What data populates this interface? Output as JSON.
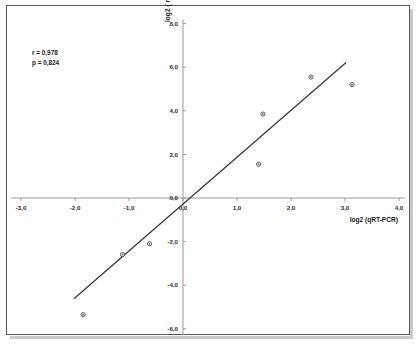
{
  "chart_data": {
    "type": "scatter",
    "title": "",
    "xlabel": "log2 (qRT-PCR)",
    "ylabel": "log2 ( microarray)",
    "xlim": [
      -3.0,
      4.0
    ],
    "ylim": [
      -6.0,
      8.0
    ],
    "xticks": [
      "-3,0",
      "-2,0",
      "-1,0",
      "0,0",
      "1,0",
      "2,0",
      "3,0",
      "4,0"
    ],
    "xtick_values": [
      -3.0,
      -2.0,
      -1.0,
      0.0,
      1.0,
      2.0,
      3.0,
      4.0
    ],
    "yticks": [
      "8,0",
      "6,0",
      "4,0",
      "2,0",
      "0,0",
      "-2,0",
      "-4,0",
      "-6,0"
    ],
    "ytick_values": [
      8.0,
      6.0,
      4.0,
      2.0,
      0.0,
      -2.0,
      -4.0,
      -6.0
    ],
    "grid": false,
    "legend": null,
    "points": [
      {
        "x": -1.85,
        "y": -5.35
      },
      {
        "x": -1.12,
        "y": -2.6
      },
      {
        "x": -0.62,
        "y": -2.1
      },
      {
        "x": 1.4,
        "y": 1.55
      },
      {
        "x": 1.48,
        "y": 3.85
      },
      {
        "x": 2.37,
        "y": 5.55
      },
      {
        "x": 3.13,
        "y": 5.2
      }
    ],
    "trendline": {
      "x_start": -2.02,
      "y_start": -4.62,
      "x_end": 3.02,
      "y_end": 6.22
    },
    "annotations": [
      {
        "label": "r = 0,978"
      },
      {
        "label": "p = 0,824"
      }
    ]
  },
  "stats": {
    "correlation": "r = 0,978",
    "pvalue": "p = 0,824"
  },
  "axes": {
    "x_title": "log2 (qRT-PCR)",
    "y_title": "log2 ( microarray)"
  }
}
